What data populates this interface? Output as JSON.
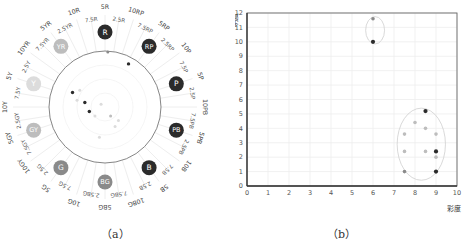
{
  "captions": {
    "a": "（a）",
    "b": "（b）"
  },
  "colors": {
    "dark": "#2b2b2b",
    "mid": "#8a8a8a",
    "light": "#bdbdbd",
    "faint": "#dcdcdc",
    "grid": "#eeeeee",
    "axis": "#555555"
  },
  "chart_data": [
    {
      "type": "scatter",
      "subtype": "polar-hue-wheel",
      "title": "",
      "hue_labels_outer": [
        "5R",
        "10RP",
        "5RP",
        "10P",
        "5P",
        "10PB",
        "5PB",
        "10B",
        "5B",
        "10BG",
        "5BG",
        "10G",
        "5G",
        "10GY",
        "5GY",
        "10Y",
        "5Y",
        "10YR",
        "5YR",
        "10R"
      ],
      "hue_labels_inner": [
        "2.5R",
        "7.5RP",
        "2.5RP",
        "7.5P",
        "2.5P",
        "7.5PB",
        "2.5PB",
        "7.5B",
        "2.5B",
        "7.5BG",
        "2.5BG",
        "7.5G",
        "2.5G",
        "7.5GY",
        "2.5GY",
        "7.5Y",
        "2.5Y",
        "7.5YR",
        "2.5YR",
        "7.5R"
      ],
      "hue_badges": [
        {
          "label": "R",
          "angle_deg": 0,
          "tone": "dark"
        },
        {
          "label": "RP",
          "angle_deg": 36,
          "tone": "dark"
        },
        {
          "label": "P",
          "angle_deg": 72,
          "tone": "dark"
        },
        {
          "label": "PB",
          "angle_deg": 108,
          "tone": "dark"
        },
        {
          "label": "B",
          "angle_deg": 144,
          "tone": "dark"
        },
        {
          "label": "BG",
          "angle_deg": 180,
          "tone": "mid"
        },
        {
          "label": "G",
          "angle_deg": 216,
          "tone": "mid"
        },
        {
          "label": "GY",
          "angle_deg": 252,
          "tone": "light"
        },
        {
          "label": "Y",
          "angle_deg": 288,
          "tone": "faint"
        },
        {
          "label": "YR",
          "angle_deg": 324,
          "tone": "light"
        }
      ],
      "points": [
        {
          "x": 0.05,
          "y": 0.98,
          "tone": "mid"
        },
        {
          "x": 0.42,
          "y": 0.77,
          "tone": "dark"
        },
        {
          "x": -0.58,
          "y": 0.26,
          "tone": "dark"
        },
        {
          "x": -0.45,
          "y": 0.3,
          "tone": "faint"
        },
        {
          "x": -0.36,
          "y": 0.08,
          "tone": "dark"
        },
        {
          "x": -0.5,
          "y": 0.12,
          "tone": "faint"
        },
        {
          "x": -0.28,
          "y": -0.08,
          "tone": "dark"
        },
        {
          "x": -0.18,
          "y": -0.16,
          "tone": "faint"
        },
        {
          "x": -0.07,
          "y": 0.05,
          "tone": "faint"
        },
        {
          "x": 0.1,
          "y": -0.16,
          "tone": "light"
        },
        {
          "x": 0.24,
          "y": -0.24,
          "tone": "faint"
        },
        {
          "x": 0.18,
          "y": -0.35,
          "tone": "faint"
        },
        {
          "x": -0.1,
          "y": -0.54,
          "tone": "faint"
        }
      ]
    },
    {
      "type": "scatter",
      "title": "",
      "xlabel": "彩度",
      "ylabel": "明度",
      "xlim": [
        0,
        10
      ],
      "ylim": [
        0,
        12
      ],
      "xticks": [
        "0",
        "1",
        "2",
        "3",
        "4",
        "5",
        "6",
        "7",
        "8",
        "9",
        "10"
      ],
      "yticks": [
        "0",
        "1",
        "2",
        "3",
        "4",
        "5",
        "6",
        "7",
        "8",
        "9",
        "10",
        "11",
        "12"
      ],
      "grid": true,
      "points": [
        {
          "x": 6.0,
          "y": 11.6,
          "tone": "mid"
        },
        {
          "x": 6.0,
          "y": 10.0,
          "tone": "dark"
        },
        {
          "x": 8.5,
          "y": 5.2,
          "tone": "dark"
        },
        {
          "x": 8.0,
          "y": 4.4,
          "tone": "light"
        },
        {
          "x": 8.5,
          "y": 4.0,
          "tone": "light"
        },
        {
          "x": 7.5,
          "y": 3.6,
          "tone": "light"
        },
        {
          "x": 9.0,
          "y": 3.6,
          "tone": "light"
        },
        {
          "x": 7.5,
          "y": 2.4,
          "tone": "light"
        },
        {
          "x": 8.5,
          "y": 2.4,
          "tone": "light"
        },
        {
          "x": 9.0,
          "y": 2.4,
          "tone": "dark"
        },
        {
          "x": 9.0,
          "y": 2.0,
          "tone": "light"
        },
        {
          "x": 7.5,
          "y": 1.0,
          "tone": "mid"
        },
        {
          "x": 9.0,
          "y": 1.0,
          "tone": "dark"
        }
      ],
      "clusters": [
        {
          "cx": 6.1,
          "cy": 10.8,
          "rx": 0.45,
          "ry": 0.95
        },
        {
          "cx": 8.3,
          "cy": 2.9,
          "rx": 1.15,
          "ry": 2.5
        }
      ]
    }
  ]
}
